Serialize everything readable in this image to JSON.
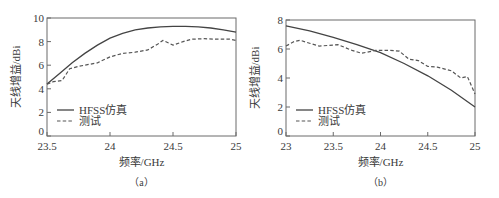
{
  "chart_data": [
    {
      "type": "line",
      "panel_label": "（a）",
      "title": "",
      "xlabel": "频率/GHz",
      "ylabel": "天线增益/dBi",
      "xlim": [
        23.5,
        25
      ],
      "ylim": [
        0,
        10
      ],
      "xticks": [
        "23.5",
        "24",
        "24.5",
        "25"
      ],
      "yticks": [
        "0",
        "2",
        "4",
        "6",
        "8",
        "10"
      ],
      "grid": false,
      "legend_position": "lower-left",
      "series": [
        {
          "name": "HFSS仿真",
          "style": "solid",
          "x": [
            23.5,
            23.6,
            23.7,
            23.8,
            23.9,
            24.0,
            24.1,
            24.2,
            24.3,
            24.4,
            24.5,
            24.6,
            24.7,
            24.8,
            24.9,
            25.0
          ],
          "y": [
            4.4,
            5.3,
            6.2,
            7.0,
            7.7,
            8.3,
            8.7,
            9.0,
            9.15,
            9.25,
            9.3,
            9.3,
            9.25,
            9.15,
            9.0,
            8.8
          ]
        },
        {
          "name": "测试",
          "style": "dashed",
          "x": [
            23.5,
            23.55,
            23.62,
            23.68,
            23.75,
            23.9,
            24.0,
            24.1,
            24.2,
            24.3,
            24.38,
            24.42,
            24.5,
            24.58,
            24.65,
            24.75,
            24.85,
            24.95,
            25.0
          ],
          "y": [
            4.4,
            4.6,
            4.7,
            5.7,
            5.9,
            6.2,
            6.7,
            7.0,
            7.1,
            7.3,
            7.8,
            8.1,
            7.7,
            8.0,
            8.2,
            8.25,
            8.2,
            8.2,
            8.1
          ]
        }
      ]
    },
    {
      "type": "line",
      "panel_label": "（b）",
      "title": "",
      "xlabel": "频率/GHz",
      "ylabel": "天线增益/dBi",
      "xlim": [
        23,
        25
      ],
      "ylim": [
        0,
        8
      ],
      "xticks": [
        "23",
        "23.5",
        "24",
        "24.5",
        "25"
      ],
      "yticks": [
        "0",
        "2",
        "4",
        "6",
        "8"
      ],
      "grid": false,
      "legend_position": "lower-left",
      "series": [
        {
          "name": "HFSS仿真",
          "style": "solid",
          "x": [
            23.0,
            23.25,
            23.5,
            23.75,
            24.0,
            24.25,
            24.5,
            24.75,
            25.0
          ],
          "y": [
            7.6,
            7.25,
            6.8,
            6.3,
            5.75,
            5.0,
            4.15,
            3.15,
            2.0
          ]
        },
        {
          "name": "测试",
          "style": "dashed",
          "x": [
            23.0,
            23.08,
            23.15,
            23.25,
            23.35,
            23.55,
            23.7,
            23.8,
            23.95,
            24.1,
            24.2,
            24.3,
            24.4,
            24.5,
            24.6,
            24.75,
            24.85,
            24.92,
            25.0
          ],
          "y": [
            6.2,
            6.5,
            6.6,
            6.4,
            6.2,
            6.3,
            5.9,
            5.7,
            5.9,
            5.9,
            5.85,
            5.3,
            5.2,
            4.8,
            4.75,
            4.5,
            4.0,
            4.1,
            2.9
          ]
        }
      ]
    }
  ]
}
